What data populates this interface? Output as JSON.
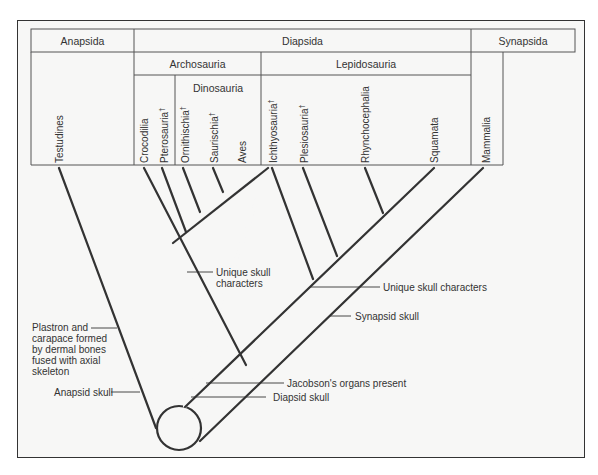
{
  "diagram": {
    "type": "cladogram",
    "top_groups": [
      {
        "label": "Anapsida"
      },
      {
        "label": "Diapsida"
      },
      {
        "label": "Synapsida"
      }
    ],
    "sub_groups": [
      {
        "label": "Archosauria"
      },
      {
        "label": "Lepidosauria"
      },
      {
        "label": "Dinosauria"
      }
    ],
    "taxa": [
      {
        "label": "Testudines",
        "extinct": ""
      },
      {
        "label": "Crocodilia",
        "extinct": ""
      },
      {
        "label": "Pterosauria",
        "extinct": "†"
      },
      {
        "label": "Ornithischia",
        "extinct": "†"
      },
      {
        "label": "Saurischia",
        "extinct": "†"
      },
      {
        "label": "Aves",
        "extinct": ""
      },
      {
        "label": "Ichthyosauria",
        "extinct": "†"
      },
      {
        "label": "Plesiosauria",
        "extinct": "†"
      },
      {
        "label": "Rhynchocephalia",
        "extinct": ""
      },
      {
        "label": "Squamata",
        "extinct": ""
      },
      {
        "label": "Mammalia",
        "extinct": ""
      }
    ],
    "characters": {
      "plastron": [
        "Plastron and",
        "carapace formed",
        "by dermal bones",
        "fused with axial",
        "skeleton"
      ],
      "anapsid": "Anapsid skull",
      "archosaur_skull": [
        "Unique skull",
        "characters"
      ],
      "lepidosaur_skull": "Unique skull characters",
      "synapsid": "Synapsid skull",
      "jacobson": "Jacobson's organs present",
      "diapsid": "Diapsid skull"
    },
    "line_color": "#333333",
    "background": "#f7f7f6"
  }
}
